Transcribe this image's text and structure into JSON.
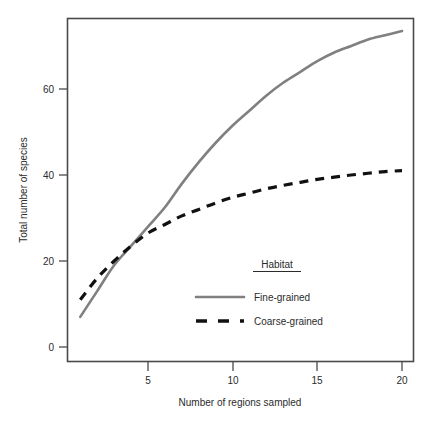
{
  "chart_data": {
    "type": "line",
    "title": "",
    "xlabel": "Number of regions sampled",
    "ylabel": "Total number of species",
    "xlim": [
      1,
      21
    ],
    "ylim": [
      -2,
      78
    ],
    "xticks": [
      "5",
      "10",
      "15",
      "20"
    ],
    "xtick_values": [
      5,
      10,
      15,
      20
    ],
    "yticks": [
      "0",
      "20",
      "40",
      "60"
    ],
    "ytick_values": [
      0,
      20,
      40,
      60
    ],
    "grid": false,
    "legend": {
      "title": "Habitat",
      "position": "inside-lower-right",
      "entries": [
        {
          "name": "Fine-grained",
          "style": "solid",
          "color": "#808080"
        },
        {
          "name": "Coarse-grained",
          "style": "dashed",
          "color": "#111111"
        }
      ]
    },
    "x": [
      1,
      2,
      3,
      4,
      5,
      6,
      7,
      8,
      9,
      10,
      11,
      12,
      13,
      14,
      15,
      16,
      17,
      18,
      19,
      20
    ],
    "series": [
      {
        "name": "Fine-grained",
        "style": "solid",
        "color": "#808080",
        "values": [
          7,
          13,
          19,
          23.5,
          28,
          32.5,
          38,
          43,
          47.5,
          51.5,
          55,
          58.5,
          61.5,
          64,
          66.5,
          68.5,
          70,
          71.5,
          72.5,
          73.5
        ]
      },
      {
        "name": "Coarse-grained",
        "style": "dashed",
        "color": "#111111",
        "values": [
          11,
          16,
          20,
          23.5,
          26.5,
          28.5,
          30.5,
          32,
          33.5,
          34.8,
          35.8,
          36.8,
          37.6,
          38.3,
          39,
          39.5,
          40,
          40.4,
          40.8,
          41
        ]
      }
    ]
  },
  "colors": {
    "frame": "#4a4a4a",
    "fine_grained": "#808080",
    "coarse_grained": "#111111",
    "text": "#2b2b2b",
    "background": "#ffffff"
  }
}
